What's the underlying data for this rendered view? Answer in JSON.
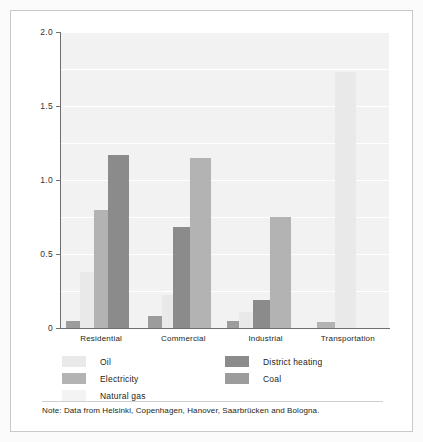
{
  "chart_data": {
    "type": "bar",
    "title": "",
    "subtitle": "",
    "xlabel": "",
    "ylabel": "CO2 (tonnes per capita)",
    "ylabel_html": "CO₂ (tonnes per capita)",
    "categories": [
      "Residential",
      "Commercial",
      "Industrial",
      "Transportation"
    ],
    "ylim": [
      0,
      2.0
    ],
    "ytick_labels": [
      "0",
      "0.5",
      "1.0",
      "1.5",
      "2.0"
    ],
    "ytick_values": [
      0,
      0.5,
      1.0,
      1.5,
      2.0
    ],
    "gridline_values": [
      0.25,
      0.5,
      0.75,
      1.0,
      1.25,
      1.5,
      1.75,
      2.0
    ],
    "grid": true,
    "legend_position": "below-axes",
    "series": [
      {
        "name": "Oil",
        "color": "#e9e9e9",
        "values": [
          0.38,
          0.22,
          0.11,
          1.73
        ]
      },
      {
        "name": "Electricity",
        "color": "#b3b3b3",
        "values": [
          0.8,
          1.15,
          0.75,
          0.04
        ]
      },
      {
        "name": "Natural gas",
        "color": "#f3f3f3",
        "values": [
          0.0,
          0.0,
          0.0,
          0.0
        ]
      },
      {
        "name": "District heating",
        "color": "#8b8b8b",
        "values": [
          1.17,
          0.68,
          0.19,
          0.0
        ]
      },
      {
        "name": "Coal",
        "color": "#9c9c9c",
        "values": [
          0.05,
          0.08,
          0.05,
          0.0
        ]
      }
    ],
    "note": "Note: Data from Helsinki, Copenhagen, Hanover, Saarbrücken and Bologna."
  },
  "legend": {
    "items": [
      {
        "label": "Oil",
        "color": "#e9e9e9"
      },
      {
        "label": "Electricity",
        "color": "#b3b3b3"
      },
      {
        "label": "Natural gas",
        "color": "#f3f3f3"
      },
      {
        "label": "District heating",
        "color": "#8b8b8b"
      },
      {
        "label": "Coal",
        "color": "#9c9c9c"
      }
    ]
  },
  "note": {
    "text": "Note: Data from Helsinki, Copenhagen, Hanover, Saarbrücken and Bologna."
  },
  "colors": {
    "plot_background": "#f2f2f2",
    "gridline": "#ffffff",
    "axis": "#6f6f6f",
    "text": "#231f20",
    "frame": "#c9c9c9"
  }
}
